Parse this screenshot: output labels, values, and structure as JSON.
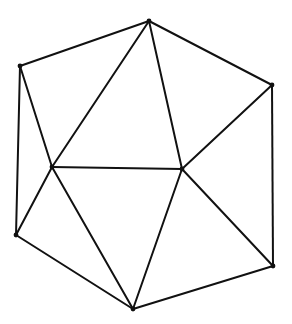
{
  "diagram": {
    "type": "planar-triangulation",
    "stroke_color": "#111111",
    "background": "#ffffff",
    "nodes": [
      {
        "id": "top",
        "x": 149,
        "y": 21
      },
      {
        "id": "upper_left",
        "x": 20,
        "y": 66
      },
      {
        "id": "upper_right",
        "x": 272,
        "y": 85
      },
      {
        "id": "inner_left",
        "x": 52,
        "y": 167
      },
      {
        "id": "inner_right",
        "x": 182,
        "y": 169
      },
      {
        "id": "lower_left",
        "x": 16,
        "y": 235
      },
      {
        "id": "lower_right",
        "x": 273,
        "y": 266
      },
      {
        "id": "bottom",
        "x": 133,
        "y": 309
      }
    ],
    "edges": [
      [
        "top",
        "upper_left"
      ],
      [
        "top",
        "upper_right"
      ],
      [
        "top",
        "inner_left"
      ],
      [
        "top",
        "inner_right"
      ],
      [
        "upper_left",
        "inner_left"
      ],
      [
        "upper_left",
        "lower_left"
      ],
      [
        "upper_right",
        "inner_right"
      ],
      [
        "upper_right",
        "lower_right"
      ],
      [
        "inner_left",
        "inner_right"
      ],
      [
        "inner_left",
        "lower_left"
      ],
      [
        "inner_left",
        "bottom"
      ],
      [
        "inner_right",
        "bottom"
      ],
      [
        "inner_right",
        "lower_right"
      ],
      [
        "lower_left",
        "bottom"
      ],
      [
        "lower_right",
        "bottom"
      ]
    ]
  }
}
